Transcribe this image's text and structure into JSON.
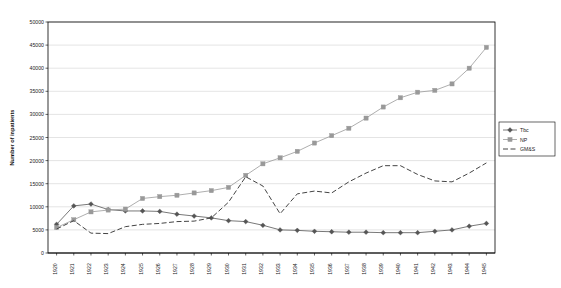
{
  "chart_data": {
    "type": "line",
    "title": "",
    "xlabel": "",
    "ylabel": "Number of inpatients",
    "ylim": [
      0,
      50000
    ],
    "ytick_step": 5000,
    "yticks": [
      "0",
      "5000",
      "10000",
      "15000",
      "20000",
      "25000",
      "30000",
      "35000",
      "40000",
      "45000",
      "50000"
    ],
    "grid": true,
    "legend_position": "right",
    "categories": [
      "1920",
      "1921",
      "1922",
      "1923",
      "1924",
      "1925",
      "1926",
      "1927",
      "1928",
      "1929",
      "1930",
      "1931",
      "1932",
      "1933",
      "1934",
      "1935",
      "1936",
      "1937",
      "1938",
      "1939",
      "1940",
      "1941",
      "1942",
      "1943",
      "1944",
      "1945"
    ],
    "series": [
      {
        "name": "Tbc",
        "color": "#555555",
        "marker": "diamond",
        "dash": "solid",
        "values": [
          6200,
          10200,
          10600,
          9400,
          9100,
          9100,
          9000,
          8400,
          8000,
          7600,
          7000,
          6800,
          6000,
          5000,
          4900,
          4700,
          4600,
          4500,
          4500,
          4400,
          4400,
          4400,
          4700,
          5000,
          5800,
          6400
        ]
      },
      {
        "name": "NP",
        "color": "#999999",
        "marker": "square",
        "dash": "solid",
        "values": [
          5500,
          7200,
          8900,
          9300,
          9500,
          11800,
          12200,
          12500,
          13000,
          13500,
          14200,
          16800,
          19300,
          20600,
          22000,
          23800,
          25400,
          27000,
          29200,
          31600,
          33600,
          34800,
          35200,
          36600,
          40000,
          44500
        ]
      },
      {
        "name": "GM&S",
        "color": "#444444",
        "marker": "none",
        "dash": "dashed",
        "values": [
          5200,
          7000,
          4300,
          4200,
          5700,
          6200,
          6400,
          6800,
          6900,
          7600,
          11000,
          16500,
          14500,
          8500,
          12800,
          13400,
          13000,
          15400,
          17300,
          18900,
          18900,
          17000,
          15600,
          15400,
          17300,
          19500
        ]
      }
    ]
  }
}
